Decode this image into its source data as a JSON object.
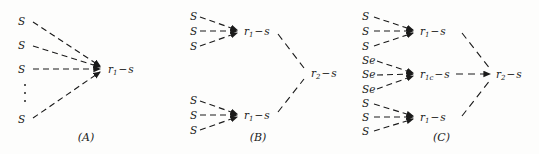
{
  "figure": {
    "width": 539,
    "height": 154,
    "background_color": "#fdfdfc",
    "ink_color": "#1a1a1a",
    "line_style": "dashed"
  },
  "panels": [
    {
      "id": "A",
      "caption": "(A)",
      "sources": [
        {
          "label": "S",
          "x": 22,
          "y": 21
        },
        {
          "label": "S",
          "x": 22,
          "y": 45
        },
        {
          "label": "S",
          "x": 22,
          "y": 69
        },
        {
          "label": "S",
          "x": 22,
          "y": 119
        }
      ],
      "ellipsis": {
        "x": 25,
        "y": 93,
        "count": 3
      },
      "targets": [
        {
          "label_base": "r",
          "subscript": "1",
          "operator": "−",
          "label_tail": "s",
          "x": 108,
          "y": 69
        }
      ]
    },
    {
      "id": "B",
      "caption": "(B)",
      "sources": [
        {
          "label": "S",
          "x": 18,
          "y": 16
        },
        {
          "label": "S",
          "x": 18,
          "y": 31
        },
        {
          "label": "S",
          "x": 18,
          "y": 46
        },
        {
          "label": "S",
          "x": 18,
          "y": 100
        },
        {
          "label": "S",
          "x": 18,
          "y": 115
        },
        {
          "label": "S",
          "x": 18,
          "y": 130
        }
      ],
      "intermediates": [
        {
          "label_base": "r",
          "subscript": "1",
          "operator": "−",
          "label_tail": "s",
          "x": 72,
          "y": 31
        },
        {
          "label_base": "r",
          "subscript": "1",
          "operator": "−",
          "label_tail": "s",
          "x": 72,
          "y": 115
        }
      ],
      "targets": [
        {
          "label_base": "r",
          "subscript": "2",
          "operator": "−",
          "label_tail": "s",
          "x": 139,
          "y": 73
        }
      ]
    },
    {
      "id": "C",
      "caption": "(C)",
      "sources": [
        {
          "label": "S",
          "x": 18,
          "y": 16
        },
        {
          "label": "S",
          "x": 18,
          "y": 31
        },
        {
          "label": "S",
          "x": 18,
          "y": 46
        },
        {
          "label": "Se",
          "x": 18,
          "y": 60
        },
        {
          "label": "Se",
          "x": 18,
          "y": 74
        },
        {
          "label": "Se",
          "x": 18,
          "y": 89
        },
        {
          "label": "S",
          "x": 18,
          "y": 103
        },
        {
          "label": "S",
          "x": 18,
          "y": 117
        },
        {
          "label": "S",
          "x": 18,
          "y": 131
        }
      ],
      "intermediates": [
        {
          "label_base": "r",
          "subscript": "1",
          "operator": "−",
          "label_tail": "s",
          "x": 76,
          "y": 31
        },
        {
          "label_base": "r",
          "subscript": "1c",
          "operator": "−",
          "label_tail": "s",
          "x": 76,
          "y": 74
        },
        {
          "label_base": "r",
          "subscript": "1",
          "operator": "−",
          "label_tail": "s",
          "x": 76,
          "y": 117
        }
      ],
      "targets": [
        {
          "label_base": "r",
          "subscript": "2",
          "operator": "−",
          "label_tail": "s",
          "x": 152,
          "y": 74
        }
      ]
    }
  ]
}
